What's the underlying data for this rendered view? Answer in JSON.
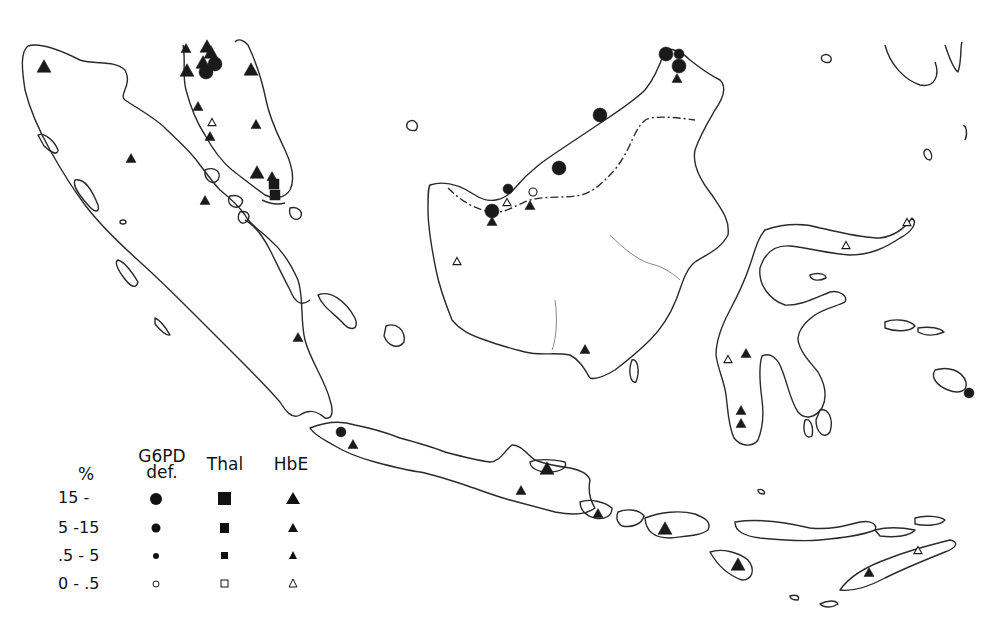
{
  "map": {
    "region": "Indonesian archipelago / Malay peninsula / Borneo",
    "ink_color": "#1a1a1a",
    "background": "#ffffff"
  },
  "legend": {
    "percent_header": "%",
    "columns": [
      {
        "key": "g6pd",
        "label_line1": "G6PD",
        "label_line2": "def.",
        "symbol": "circle"
      },
      {
        "key": "thal",
        "label_line1": "Thal",
        "label_line2": "",
        "symbol": "square"
      },
      {
        "key": "hbe",
        "label_line1": "HbE",
        "label_line2": "",
        "symbol": "triangle"
      }
    ],
    "rows": [
      {
        "label": "15 -",
        "size": "large",
        "filled": true
      },
      {
        "label": "5 -15",
        "size": "medium",
        "filled": true
      },
      {
        "label": ".5 - 5",
        "size": "small",
        "filled": true
      },
      {
        "label": "0 - .5",
        "size": "small",
        "filled": false
      }
    ]
  },
  "markers": [
    {
      "type": "hbe",
      "class": "15-",
      "x": 44,
      "y": 66
    },
    {
      "type": "hbe",
      "class": "5-15",
      "x": 186,
      "y": 48
    },
    {
      "type": "hbe",
      "class": "15-",
      "x": 187,
      "y": 70
    },
    {
      "type": "hbe",
      "class": "15-",
      "x": 207,
      "y": 46
    },
    {
      "type": "hbe",
      "class": "15-",
      "x": 211,
      "y": 52
    },
    {
      "type": "hbe",
      "class": "15-",
      "x": 203,
      "y": 62
    },
    {
      "type": "g6pd",
      "class": "15-",
      "x": 215,
      "y": 64
    },
    {
      "type": "g6pd",
      "class": "15-",
      "x": 206,
      "y": 72
    },
    {
      "type": "hbe",
      "class": "15-",
      "x": 251,
      "y": 69
    },
    {
      "type": "hbe",
      "class": "5-15",
      "x": 198,
      "y": 106
    },
    {
      "type": "hbe",
      "class": "0-.5",
      "x": 212,
      "y": 122
    },
    {
      "type": "hbe",
      "class": "5-15",
      "x": 256,
      "y": 124
    },
    {
      "type": "hbe",
      "class": "5-15",
      "x": 210,
      "y": 136
    },
    {
      "type": "hbe",
      "class": "5-15",
      "x": 131,
      "y": 158
    },
    {
      "type": "hbe",
      "class": "15-",
      "x": 257,
      "y": 172
    },
    {
      "type": "hbe",
      "class": "5-15",
      "x": 272,
      "y": 176
    },
    {
      "type": "thal",
      "class": "5-15",
      "x": 274,
      "y": 184
    },
    {
      "type": "thal",
      "class": "5-15",
      "x": 275,
      "y": 195
    },
    {
      "type": "hbe",
      "class": "5-15",
      "x": 205,
      "y": 200
    },
    {
      "type": "g6pd",
      "class": "15-",
      "x": 666,
      "y": 54
    },
    {
      "type": "g6pd",
      "class": "5-15",
      "x": 679,
      "y": 54
    },
    {
      "type": "g6pd",
      "class": "15-",
      "x": 679,
      "y": 66
    },
    {
      "type": "hbe",
      "class": "5-15",
      "x": 677,
      "y": 78
    },
    {
      "type": "g6pd",
      "class": "15-",
      "x": 600,
      "y": 115
    },
    {
      "type": "g6pd",
      "class": "15-",
      "x": 559,
      "y": 168
    },
    {
      "type": "g6pd",
      "class": "5-15",
      "x": 508,
      "y": 189
    },
    {
      "type": "g6pd",
      "class": "0-.5",
      "x": 533,
      "y": 192
    },
    {
      "type": "hbe",
      "class": "0-.5",
      "x": 507,
      "y": 202
    },
    {
      "type": "hbe",
      "class": "5-15",
      "x": 530,
      "y": 205
    },
    {
      "type": "g6pd",
      "class": "15-",
      "x": 492,
      "y": 211
    },
    {
      "type": "hbe",
      "class": "5-15",
      "x": 492,
      "y": 221
    },
    {
      "type": "hbe",
      "class": "0-.5",
      "x": 457,
      "y": 261
    },
    {
      "type": "hbe",
      "class": "5-15",
      "x": 585,
      "y": 349
    },
    {
      "type": "hbe",
      "class": "5-15",
      "x": 298,
      "y": 337
    },
    {
      "type": "hbe",
      "class": "0-.5",
      "x": 907,
      "y": 222
    },
    {
      "type": "hbe",
      "class": "0-.5",
      "x": 846,
      "y": 245
    },
    {
      "type": "hbe",
      "class": "5-15",
      "x": 746,
      "y": 353
    },
    {
      "type": "hbe",
      "class": "0-.5",
      "x": 728,
      "y": 359
    },
    {
      "type": "hbe",
      "class": "5-15",
      "x": 741,
      "y": 410
    },
    {
      "type": "hbe",
      "class": "5-15",
      "x": 741,
      "y": 423
    },
    {
      "type": "g6pd",
      "class": "5-15",
      "x": 969,
      "y": 393
    },
    {
      "type": "g6pd",
      "class": "5-15",
      "x": 341,
      "y": 432
    },
    {
      "type": "hbe",
      "class": "5-15",
      "x": 353,
      "y": 444
    },
    {
      "type": "hbe",
      "class": "15-",
      "x": 547,
      "y": 468
    },
    {
      "type": "hbe",
      "class": "5-15",
      "x": 521,
      "y": 490
    },
    {
      "type": "hbe",
      "class": "5-15",
      "x": 598,
      "y": 513
    },
    {
      "type": "hbe",
      "class": "15-",
      "x": 665,
      "y": 528
    },
    {
      "type": "hbe",
      "class": "15-",
      "x": 738,
      "y": 564
    },
    {
      "type": "hbe",
      "class": "5-15",
      "x": 869,
      "y": 572
    },
    {
      "type": "hbe",
      "class": "0-.5",
      "x": 918,
      "y": 550
    }
  ]
}
